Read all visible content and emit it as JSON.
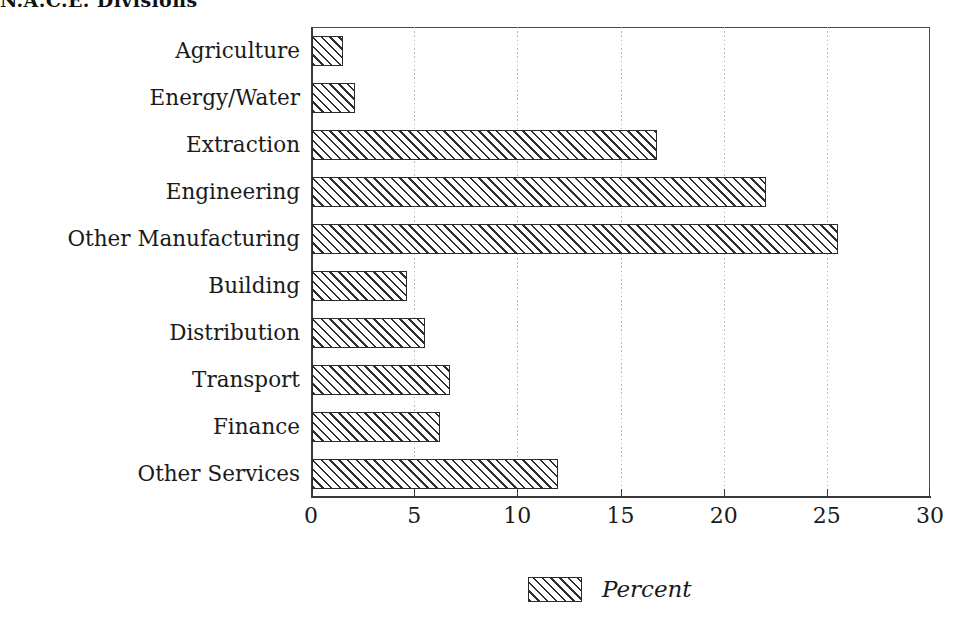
{
  "chart_data": {
    "type": "bar",
    "orientation": "horizontal",
    "title": "N.A.C.E. Divisions",
    "xlabel": "",
    "ylabel": "",
    "xlim": [
      0,
      30
    ],
    "xticks": [
      0,
      5,
      10,
      15,
      20,
      25,
      30
    ],
    "xtick_labels": [
      "0",
      "5",
      "10",
      "15",
      "20",
      "25",
      "30"
    ],
    "grid": true,
    "grid_axis": "x",
    "grid_style": "dotted",
    "legend": {
      "position": "bottom-center",
      "entries": [
        {
          "label": "Percent",
          "fill": "diagonal-hatch",
          "style": "italic"
        }
      ]
    },
    "series_name": "Percent",
    "unit": "percent",
    "categories": [
      "Agriculture",
      "Energy/Water",
      "Extraction",
      "Engineering",
      "Other Manufacturing",
      "Building",
      "Distribution",
      "Transport",
      "Finance",
      "Other Services"
    ],
    "values": [
      1.5,
      2.1,
      16.7,
      22.0,
      25.5,
      4.6,
      5.5,
      6.7,
      6.2,
      11.9
    ],
    "points": [
      {
        "category": "Agriculture",
        "value": 1.5
      },
      {
        "category": "Energy/Water",
        "value": 2.1
      },
      {
        "category": "Extraction",
        "value": 16.7
      },
      {
        "category": "Engineering",
        "value": 22.0
      },
      {
        "category": "Other Manufacturing",
        "value": 25.5
      },
      {
        "category": "Building",
        "value": 4.6
      },
      {
        "category": "Distribution",
        "value": 5.5
      },
      {
        "category": "Transport",
        "value": 6.7
      },
      {
        "category": "Finance",
        "value": 6.2
      },
      {
        "category": "Other Services",
        "value": 11.9
      }
    ],
    "colors": {
      "bar_fill": "#ffffff",
      "bar_hatch": "#2f2f2f",
      "bar_edge": "#2b2b2b",
      "axis": "#3a3a3a",
      "grid": "#b9b9b9",
      "text": "#1a1a1a",
      "background": "#ffffff"
    }
  }
}
